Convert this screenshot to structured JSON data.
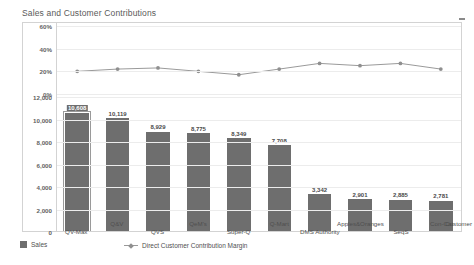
{
  "title": "Sales and Customer Contributions",
  "controls": {
    "collapse_icon": "minimize-icon"
  },
  "legend": {
    "sales_label": "Sales",
    "margin_label": "Direct Customer Contribution Margin"
  },
  "axes": {
    "pct_ticks": [
      "60%",
      "40%",
      "20%",
      "0%"
    ],
    "value_ticks": [
      "12,000",
      "10,000",
      "8,000",
      "6,000",
      "4,000",
      "2,000",
      "0"
    ]
  },
  "category_overflow_label": "Customer",
  "chart_data": {
    "type": "bar",
    "title": "Sales and Customer Contributions",
    "xlabel": "",
    "ylabel": "",
    "grid": true,
    "legend_position": "bottom",
    "categories": [
      "QV-Max",
      "Q&V",
      "QVS",
      "QeM's",
      "Super-Q",
      "Q-Mart",
      "DMS Authority",
      "Apples&Oranges",
      "SeqS",
      "Con-Cat"
    ],
    "series": [
      {
        "name": "Sales",
        "type": "bar",
        "axis": "left-lower",
        "ylim": [
          0,
          12000
        ],
        "values": [
          10608,
          10119,
          8929,
          8775,
          8349,
          7708,
          3342,
          2901,
          2885,
          2781
        ],
        "value_labels": [
          "10,608",
          "10,119",
          "8,929",
          "8,775",
          "8,349",
          "7,708",
          "3,342",
          "2,901",
          "2,885",
          "2,781"
        ],
        "selected_index": 0,
        "color": "#6e6e6e"
      },
      {
        "name": "Direct Customer Contribution Margin",
        "type": "line",
        "axis": "left-upper",
        "ylim": [
          0,
          60
        ],
        "unit": "%",
        "values": [
          20,
          22,
          23,
          20,
          17,
          22,
          27,
          25,
          27,
          22
        ],
        "color": "#9a9a9a"
      }
    ]
  }
}
